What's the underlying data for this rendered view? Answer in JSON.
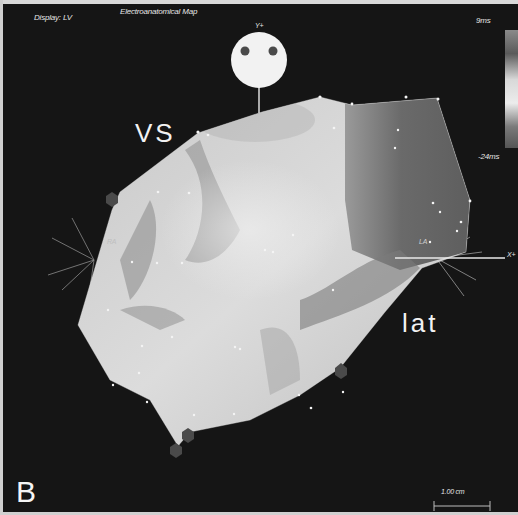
{
  "header": {
    "display_label": "Display: LV",
    "map_title": "Electroanatomical Map"
  },
  "colorbar": {
    "max_label": "9ms",
    "min_label": "-24ms",
    "max_value_ms": 9,
    "min_value_ms": -24,
    "gradient_colors": [
      "#8a8a8a",
      "#5a5a5a",
      "#d8d8d8",
      "#ececec",
      "#7a7a7a",
      "#555555"
    ]
  },
  "orientation": {
    "y_axis_label": "Y+",
    "x_axis_label": "X+",
    "left_marker": "RA",
    "right_marker": "LA"
  },
  "annotations": {
    "septal_label": "VS",
    "lateral_label": "lat",
    "panel_letter": "B"
  },
  "scale_bar": {
    "label": "1.00 cm"
  },
  "colors": {
    "background": "#151515",
    "surface_light": "#d9d9d9",
    "surface_dark": "#6e6e6e",
    "ablation_marker": "#4a4a4a",
    "text": "#e6e6e6"
  }
}
